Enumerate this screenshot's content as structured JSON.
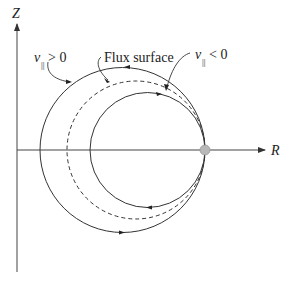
{
  "axes": {
    "vertical_label": "Z",
    "horizontal_label": "R"
  },
  "labels": {
    "v_par_positive": {
      "symbol": "v",
      "subscript": "||",
      "relation": "> 0"
    },
    "flux_surface": "Flux surface",
    "v_par_negative": {
      "symbol": "v",
      "subscript": "||",
      "relation": "< 0"
    }
  },
  "curves": [
    {
      "name": "outer-orbit",
      "style": "solid",
      "meaning": "v_parallel > 0"
    },
    {
      "name": "flux-surface",
      "style": "dashed",
      "meaning": "Flux surface"
    },
    {
      "name": "inner-orbit",
      "style": "solid",
      "meaning": "v_parallel < 0"
    }
  ],
  "colors": {
    "line": "#333333",
    "marker": "#b8b8b8"
  }
}
